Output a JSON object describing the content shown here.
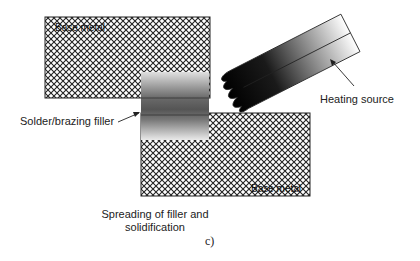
{
  "diagram": {
    "panel_label": "c)",
    "caption_line1": "Spreading of filler and",
    "caption_line2": "solidification",
    "labels": {
      "top_base_metal": "Base metal",
      "bottom_base_metal": "Base metal",
      "filler": "Solder/brazing filler",
      "heating_source": "Heating source"
    },
    "colors": {
      "hatch": "#222222",
      "filler_dark": "#555555",
      "filler_light": "#e6e6e6",
      "torch_dark": "#000000",
      "torch_light": "#ffffff"
    }
  }
}
